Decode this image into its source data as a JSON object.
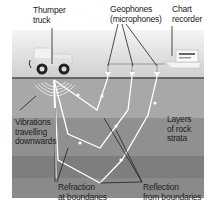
{
  "diagram": {
    "labels": {
      "thumper_truck": "Thumper\ntruck",
      "geophones": "Geophones\n(microphones)",
      "chart_recorder": "Chart\nrecorder",
      "vibrations": "Vibrations\ntravelling\ndownwards",
      "layers": "Layers\nof rock\nstrata",
      "refraction": "Refraction\nat boundaries",
      "reflection": "Reflection\nfrom boundaries"
    },
    "colors": {
      "sky": "#e4e4e4",
      "ground_surface": "#555555",
      "layer1": "#a9a9a9",
      "layer2": "#8f8f8f",
      "layer3": "#7d7d7d",
      "ray": "#ffffff",
      "leader": "#222222"
    }
  }
}
